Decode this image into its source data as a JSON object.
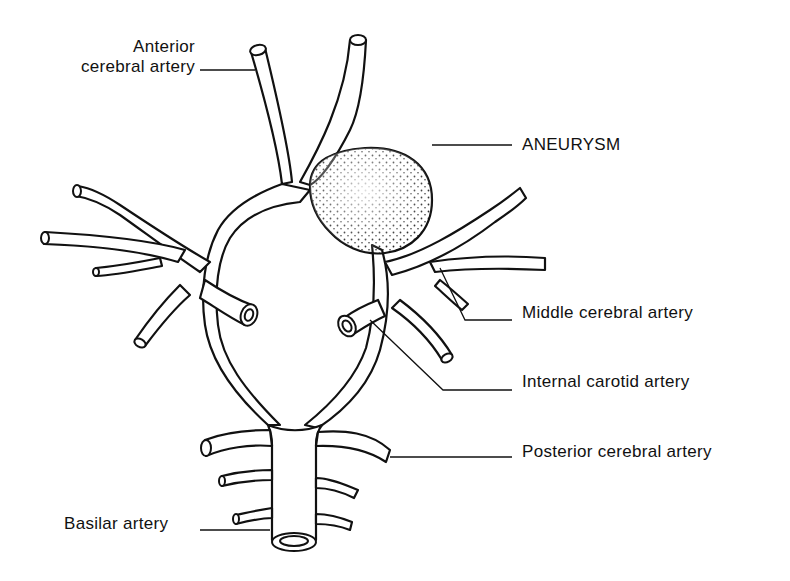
{
  "diagram": {
    "type": "anatomical-illustration",
    "labels": {
      "anterior_cerebral_line1": "Anterior",
      "anterior_cerebral_line2": "cerebral artery",
      "aneurysm": "ANEURYSM",
      "middle_cerebral": "Middle cerebral artery",
      "internal_carotid": "Internal carotid artery",
      "posterior_cerebral": "Posterior cerebral artery",
      "basilar": "Basilar artery"
    },
    "colors": {
      "ink": "#111111",
      "background": "#ffffff"
    }
  }
}
